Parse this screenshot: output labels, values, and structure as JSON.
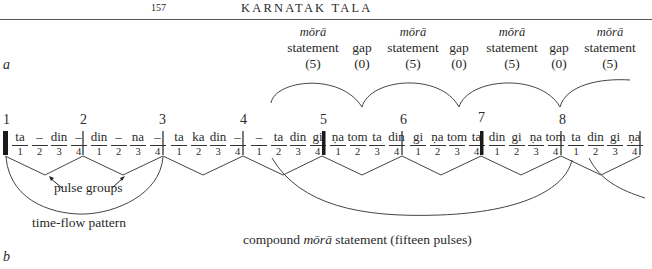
{
  "header": {
    "page_number": "157",
    "running_head": "KARNATAK TALA"
  },
  "panels": {
    "a": "a",
    "b": "b"
  },
  "mora_labels": [
    {
      "top": "mōrā",
      "mid": "statement",
      "count": "(5)"
    },
    {
      "top": "",
      "mid": "gap",
      "count": "(0)"
    },
    {
      "top": "mōrā",
      "mid": "statement",
      "count": "(5)"
    },
    {
      "top": "",
      "mid": "gap",
      "count": "(0)"
    },
    {
      "top": "mōrā",
      "mid": "statement",
      "count": "(5)"
    },
    {
      "top": "",
      "mid": "gap",
      "count": "(0)"
    },
    {
      "top": "mōrā",
      "mid": "statement",
      "count": "(5)"
    }
  ],
  "beats": [
    {
      "number": "1",
      "syllables": [
        "ta",
        "–",
        "din",
        "–"
      ],
      "pulses": [
        "1",
        "2",
        "3",
        "4"
      ]
    },
    {
      "number": "2",
      "syllables": [
        "din",
        "–",
        "na",
        "–"
      ],
      "pulses": [
        "1",
        "2",
        "3",
        "4"
      ]
    },
    {
      "number": "3",
      "syllables": [
        "ta",
        "ka",
        "din",
        "–"
      ],
      "pulses": [
        "1",
        "2",
        "3",
        "4"
      ]
    },
    {
      "number": "4",
      "syllables": [
        "–",
        "ta",
        "din",
        "gi"
      ],
      "pulses": [
        "1",
        "2",
        "3",
        "4"
      ]
    },
    {
      "number": "5",
      "syllables": [
        "ṇa",
        "tom",
        "ta",
        "din"
      ],
      "pulses": [
        "1",
        "2",
        "3",
        "4"
      ]
    },
    {
      "number": "6",
      "syllables": [
        "gi",
        "ṇa",
        "tom",
        "ta"
      ],
      "pulses": [
        "1",
        "2",
        "3",
        "4"
      ]
    },
    {
      "number": "7",
      "syllables": [
        "din",
        "gi",
        "ṇa",
        "tom"
      ],
      "pulses": [
        "1",
        "2",
        "3",
        "4"
      ]
    },
    {
      "number": "8",
      "syllables": [
        "ta",
        "din",
        "gi",
        "ṇa"
      ],
      "pulses": [
        "1",
        "2",
        "3",
        "4"
      ]
    }
  ],
  "annotations": {
    "pulse_groups": "pulse groups",
    "time_flow": "time-flow pattern",
    "compound_prefix": "compound ",
    "compound_italic": "mōrā",
    "compound_suffix": " statement (fifteen pulses)"
  }
}
